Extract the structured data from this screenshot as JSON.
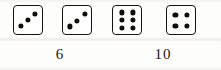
{
  "scene": {
    "background_color": "#fdfdfc",
    "ink_color": "#100e0b"
  },
  "dice": [
    {
      "name": "die-1",
      "value": 3,
      "arrangement": "diagonal-ascending",
      "pips": [
        {
          "x": 24,
          "y": 72
        },
        {
          "x": 50,
          "y": 50
        },
        {
          "x": 76,
          "y": 27
        }
      ]
    },
    {
      "name": "die-2",
      "value": 3,
      "arrangement": "diagonal-ascending",
      "pips": [
        {
          "x": 24,
          "y": 73
        },
        {
          "x": 50,
          "y": 52
        },
        {
          "x": 77,
          "y": 28
        }
      ]
    },
    {
      "name": "die-3",
      "value": 6,
      "arrangement": "two-columns-of-three",
      "pips": [
        {
          "x": 31,
          "y": 23
        },
        {
          "x": 31,
          "y": 50
        },
        {
          "x": 31,
          "y": 77
        },
        {
          "x": 70,
          "y": 23
        },
        {
          "x": 70,
          "y": 50
        },
        {
          "x": 70,
          "y": 77
        }
      ]
    },
    {
      "name": "die-4",
      "value": 4,
      "arrangement": "four-corners",
      "pips": [
        {
          "x": 30,
          "y": 31
        },
        {
          "x": 70,
          "y": 31
        },
        {
          "x": 30,
          "y": 70
        },
        {
          "x": 70,
          "y": 70
        }
      ]
    }
  ],
  "labels": [
    {
      "name": "sum-label-1",
      "text": "6"
    },
    {
      "name": "sum-label-2",
      "text": "10"
    }
  ]
}
